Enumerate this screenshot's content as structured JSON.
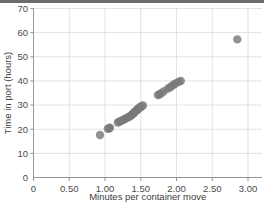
{
  "chart_data": {
    "type": "scatter",
    "title": "",
    "xlabel": "Minutes per container move",
    "ylabel": "Time in port (hours)",
    "xlim": [
      0,
      3.0
    ],
    "ylim": [
      0,
      70
    ],
    "xticks": [
      0,
      0.5,
      1.0,
      1.5,
      2.0,
      2.5,
      3.0
    ],
    "xticklabels": [
      "0",
      "0.50",
      "1.00",
      "1.50",
      "2.00",
      "2.50",
      "3.00"
    ],
    "yticks": [
      0,
      10,
      20,
      30,
      40,
      50,
      60,
      70
    ],
    "yticklabels": [
      "0",
      "10",
      "20",
      "30",
      "40",
      "50",
      "60",
      "70"
    ],
    "grid": true,
    "legend": null,
    "marker_color": "#7a7a7a",
    "marker_size": 6,
    "points": [
      {
        "x": 0.93,
        "y": 17.6
      },
      {
        "x": 1.04,
        "y": 20.2
      },
      {
        "x": 1.06,
        "y": 20.4
      },
      {
        "x": 1.07,
        "y": 20.6
      },
      {
        "x": 1.18,
        "y": 22.8
      },
      {
        "x": 1.2,
        "y": 23.1
      },
      {
        "x": 1.22,
        "y": 23.4
      },
      {
        "x": 1.25,
        "y": 23.8
      },
      {
        "x": 1.28,
        "y": 24.2
      },
      {
        "x": 1.3,
        "y": 24.6
      },
      {
        "x": 1.32,
        "y": 24.9
      },
      {
        "x": 1.34,
        "y": 25.2
      },
      {
        "x": 1.36,
        "y": 25.6
      },
      {
        "x": 1.37,
        "y": 25.9
      },
      {
        "x": 1.39,
        "y": 26.3
      },
      {
        "x": 1.4,
        "y": 26.6
      },
      {
        "x": 1.41,
        "y": 26.9
      },
      {
        "x": 1.42,
        "y": 27.2
      },
      {
        "x": 1.43,
        "y": 27.5
      },
      {
        "x": 1.44,
        "y": 27.8
      },
      {
        "x": 1.45,
        "y": 28.0
      },
      {
        "x": 1.46,
        "y": 28.3
      },
      {
        "x": 1.47,
        "y": 28.6
      },
      {
        "x": 1.48,
        "y": 28.9
      },
      {
        "x": 1.5,
        "y": 29.2
      },
      {
        "x": 1.51,
        "y": 29.5
      },
      {
        "x": 1.53,
        "y": 29.8
      },
      {
        "x": 1.74,
        "y": 34.2
      },
      {
        "x": 1.76,
        "y": 34.4
      },
      {
        "x": 1.78,
        "y": 34.8
      },
      {
        "x": 1.82,
        "y": 35.6
      },
      {
        "x": 1.88,
        "y": 36.8
      },
      {
        "x": 1.91,
        "y": 37.4
      },
      {
        "x": 1.94,
        "y": 38.0
      },
      {
        "x": 1.97,
        "y": 38.6
      },
      {
        "x": 2.0,
        "y": 39.2
      },
      {
        "x": 2.03,
        "y": 39.6
      },
      {
        "x": 2.06,
        "y": 40.0
      },
      {
        "x": 2.85,
        "y": 57.2
      }
    ]
  }
}
